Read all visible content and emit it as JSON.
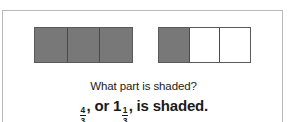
{
  "figure": {
    "type": "fraction-bar-model",
    "border_color": "#b9b9b9",
    "shade_color": "#787878",
    "outline_color": "#5a5a5a",
    "models": [
      {
        "name": "bar-model-1",
        "total_cells": 3,
        "shaded_cells": 3,
        "cells": [
          "shaded",
          "shaded",
          "shaded"
        ]
      },
      {
        "name": "bar-model-2",
        "total_cells": 3,
        "shaded_cells": 1,
        "cells": [
          "shaded",
          "unshaded",
          "unshaded"
        ]
      }
    ]
  },
  "caption": {
    "question": "What part is shaded?",
    "answer": {
      "improper_fraction": {
        "numerator": "4",
        "denominator": "3"
      },
      "separator": ", or ",
      "mixed_number": {
        "whole": "1",
        "numerator": "1",
        "denominator": "3"
      },
      "suffix": ", is shaded.",
      "full_text": "4/3, or 1 1/3, is shaded."
    }
  },
  "chart_data": {
    "type": "bar",
    "title": "What part is shaded?",
    "categories": [
      "bar-model-1",
      "bar-model-2"
    ],
    "series": [
      {
        "name": "shaded thirds",
        "values": [
          3,
          1
        ]
      },
      {
        "name": "unshaded thirds",
        "values": [
          0,
          2
        ]
      }
    ],
    "total_shaded_thirds": 4,
    "value_improper": "4/3",
    "value_mixed": "1 1/3",
    "xlabel": "",
    "ylabel": "",
    "grid": false,
    "legend": "none"
  }
}
